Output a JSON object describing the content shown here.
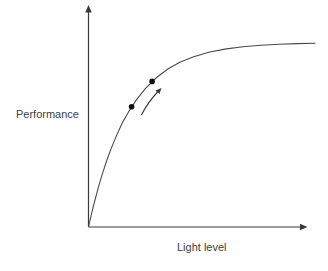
{
  "chart_data": {
    "type": "line",
    "title": "",
    "xlabel": "Light level",
    "ylabel": "Performance",
    "xlim": [
      0,
      1
    ],
    "ylim": [
      0,
      1
    ],
    "grid": false,
    "legend": "none",
    "ticks": "none",
    "axis_style": "arrowed axes, qualitative sketch, no tick labels",
    "series": [
      {
        "name": "performance-vs-light-level",
        "x": [
          0,
          0.01,
          0.02,
          0.03,
          0.045,
          0.06,
          0.08,
          0.1,
          0.125,
          0.15,
          0.18,
          0.21,
          0.25,
          0.3,
          0.35,
          0.4,
          0.46,
          0.53,
          0.6,
          0.68,
          0.76,
          0.84,
          0.92,
          1
        ],
        "y": [
          0,
          0.046,
          0.089,
          0.13,
          0.188,
          0.241,
          0.305,
          0.362,
          0.426,
          0.481,
          0.537,
          0.585,
          0.638,
          0.689,
          0.728,
          0.758,
          0.784,
          0.805,
          0.82,
          0.831,
          0.838,
          0.842,
          0.845,
          0.847
        ]
      }
    ],
    "marked_points": [
      {
        "x": 0.19,
        "y": 0.554
      },
      {
        "x": 0.28,
        "y": 0.671
      }
    ],
    "annotations": [
      {
        "type": "arrow",
        "from": {
          "x": 0.233,
          "y": 0.516
        },
        "to": {
          "x": 0.305,
          "y": 0.622
        }
      }
    ],
    "colors": {
      "curve": "#4a4a4a",
      "axis": "#3a3a3a",
      "points": "#111111",
      "labels": "#404040",
      "background": "#ffffff"
    }
  }
}
